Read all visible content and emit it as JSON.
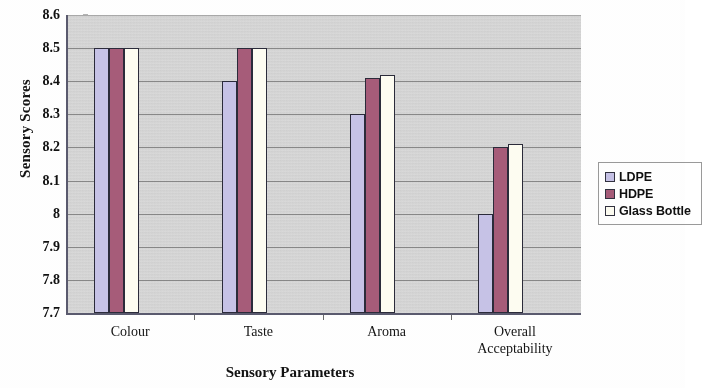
{
  "chart_data": {
    "type": "bar",
    "title": "",
    "xlabel": "Sensory Parameters",
    "ylabel": "Sensory Scores",
    "categories": [
      "Colour",
      "Taste",
      "Aroma",
      "Overall Acceptability"
    ],
    "series": [
      {
        "name": "LDPE",
        "color": "#c6c2e6",
        "values": [
          8.5,
          8.4,
          8.3,
          8.0
        ]
      },
      {
        "name": "HDPE",
        "color": "#a65c79",
        "values": [
          8.5,
          8.5,
          8.41,
          8.2
        ]
      },
      {
        "name": "Glass Bottle",
        "color": "#fdfcf1",
        "values": [
          8.5,
          8.5,
          8.42,
          8.21
        ]
      }
    ],
    "ylim": [
      7.7,
      8.6
    ],
    "ytick_step": 0.1,
    "yticks": [
      "8.6",
      "8.5",
      "8.4",
      "8.3",
      "8.2",
      "8.1",
      "8",
      "7.9",
      "7.8",
      "7.7"
    ],
    "grid": true,
    "legend_position": "right"
  },
  "axes": {
    "y_title": "Sensory Scores",
    "x_title": "Sensory Parameters",
    "category_labels": [
      {
        "line1": "Colour",
        "line2": ""
      },
      {
        "line1": "Taste",
        "line2": ""
      },
      {
        "line1": "Aroma",
        "line2": ""
      },
      {
        "line1": "Overall",
        "line2": "Acceptability"
      }
    ]
  },
  "legend": {
    "items": [
      {
        "label": "LDPE",
        "color": "#c6c2e6"
      },
      {
        "label": "HDPE",
        "color": "#a65c79"
      },
      {
        "label": "Glass Bottle",
        "color": "#fdfcf1"
      }
    ]
  },
  "colors": {
    "plot_background": "#d2d2d2",
    "gridline": "#7a7a7a",
    "axis": "#5a5a6e",
    "bar_border": "#2b2b3a"
  }
}
